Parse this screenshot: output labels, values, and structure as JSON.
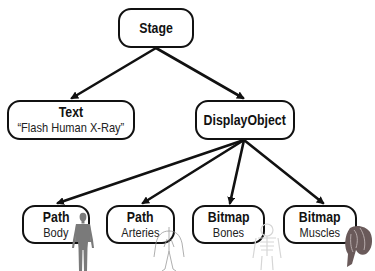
{
  "diagram": {
    "type": "tree",
    "nodes": {
      "stage": {
        "title": "Stage"
      },
      "text": {
        "title": "Text",
        "subtitle": "“Flash Human X-Ray”"
      },
      "display_object": {
        "title": "DisplayObject"
      },
      "path_body": {
        "title": "Path",
        "subtitle": "Body",
        "illustration": "human-body-silhouette-icon"
      },
      "path_arteries": {
        "title": "Path",
        "subtitle": "Arteries",
        "illustration": "arteries-icon"
      },
      "bitmap_bones": {
        "title": "Bitmap",
        "subtitle": "Bones",
        "illustration": "bones-icon"
      },
      "bitmap_muscles": {
        "title": "Bitmap",
        "subtitle": "Muscles",
        "illustration": "muscles-icon"
      }
    },
    "edges": [
      {
        "from": "Stage",
        "to": "Text"
      },
      {
        "from": "Stage",
        "to": "DisplayObject"
      },
      {
        "from": "DisplayObject",
        "to": "Path Body"
      },
      {
        "from": "DisplayObject",
        "to": "Path Arteries"
      },
      {
        "from": "DisplayObject",
        "to": "Bitmap Bones"
      },
      {
        "from": "DisplayObject",
        "to": "Bitmap Muscles"
      }
    ],
    "colors": {
      "stroke": "#111111",
      "background": "#ffffff",
      "body_fill": "#777777",
      "muscle_fill": "#6a5a5a"
    }
  }
}
